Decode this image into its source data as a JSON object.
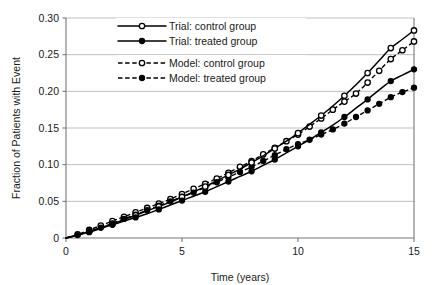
{
  "chart_data": {
    "type": "line",
    "title": "",
    "xlabel": "Time (years)",
    "ylabel": "Fraction of Patients with Event",
    "xlim": [
      0,
      15
    ],
    "ylim": [
      0,
      0.3
    ],
    "xticks": [
      "0",
      "5",
      "10",
      "15"
    ],
    "xtick_values": [
      0,
      5,
      10,
      15
    ],
    "yticks": [
      "0",
      "0.05",
      "0.10",
      "0.15",
      "0.20",
      "0.25",
      "0.30"
    ],
    "ytick_values": [
      0,
      0.05,
      0.1,
      0.15,
      0.2,
      0.25,
      0.3
    ],
    "grid": "horizontal",
    "legend_position": "upper-left-inside",
    "series": [
      {
        "name": "Trial: control group",
        "style": "solid",
        "marker": "open-circle",
        "color": "#000000",
        "x": [
          0,
          0.5,
          1,
          1.5,
          2,
          2.5,
          3,
          3.5,
          4,
          4.5,
          5,
          5.5,
          6,
          6.5,
          7,
          7.5,
          8,
          8.5,
          9,
          9.5,
          10,
          10.5,
          11,
          11.5,
          12,
          12.5,
          13,
          13.5,
          14,
          14.5,
          15
        ],
        "y": [
          0,
          0.004,
          0.009,
          0.014,
          0.019,
          0.025,
          0.031,
          0.037,
          0.043,
          0.049,
          0.056,
          0.063,
          0.07,
          0.078,
          0.086,
          0.094,
          0.103,
          0.112,
          0.122,
          0.132,
          0.143,
          0.155,
          0.167,
          0.18,
          0.194,
          0.209,
          0.225,
          0.242,
          0.259,
          0.271,
          0.283
        ]
      },
      {
        "name": "Trial: treated group",
        "style": "solid",
        "marker": "filled-circle",
        "color": "#000000",
        "x": [
          0,
          0.5,
          1,
          1.5,
          2,
          2.5,
          3,
          3.5,
          4,
          4.5,
          5,
          5.5,
          6,
          6.5,
          7,
          7.5,
          8,
          8.5,
          9,
          9.5,
          10,
          10.5,
          11,
          11.5,
          12,
          12.5,
          13,
          13.5,
          14,
          14.5,
          15
        ],
        "y": [
          0,
          0.004,
          0.008,
          0.013,
          0.018,
          0.023,
          0.028,
          0.033,
          0.039,
          0.045,
          0.051,
          0.057,
          0.063,
          0.07,
          0.077,
          0.084,
          0.091,
          0.099,
          0.107,
          0.116,
          0.125,
          0.134,
          0.144,
          0.154,
          0.165,
          0.177,
          0.189,
          0.202,
          0.214,
          0.222,
          0.23
        ]
      },
      {
        "name": "Model: control group",
        "style": "dashed",
        "marker": "open-circle",
        "color": "#000000",
        "x": [
          0,
          0.5,
          1,
          1.5,
          2,
          2.5,
          3,
          3.5,
          4,
          4.5,
          5,
          5.5,
          6,
          6.5,
          7,
          7.5,
          8,
          8.5,
          9,
          9.5,
          10,
          10.5,
          11,
          11.5,
          12,
          12.5,
          13,
          13.5,
          14,
          14.5,
          15
        ],
        "y": [
          0,
          0.005,
          0.011,
          0.017,
          0.023,
          0.029,
          0.035,
          0.041,
          0.047,
          0.053,
          0.06,
          0.067,
          0.074,
          0.081,
          0.089,
          0.097,
          0.105,
          0.114,
          0.123,
          0.132,
          0.141,
          0.152,
          0.163,
          0.175,
          0.186,
          0.197,
          0.212,
          0.228,
          0.244,
          0.256,
          0.268
        ]
      },
      {
        "name": "Model: treated group",
        "style": "dashed",
        "marker": "filled-circle",
        "color": "#000000",
        "x": [
          0,
          0.5,
          1,
          1.5,
          2,
          2.5,
          3,
          3.5,
          4,
          4.5,
          5,
          5.5,
          6,
          6.5,
          7,
          7.5,
          8,
          8.5,
          9,
          9.5,
          10,
          10.5,
          11,
          11.5,
          12,
          12.5,
          13,
          13.5,
          14,
          14.5,
          15
        ],
        "y": [
          0,
          0.004,
          0.009,
          0.014,
          0.02,
          0.026,
          0.032,
          0.038,
          0.044,
          0.05,
          0.056,
          0.062,
          0.069,
          0.076,
          0.083,
          0.09,
          0.097,
          0.105,
          0.113,
          0.121,
          0.128,
          0.134,
          0.141,
          0.148,
          0.156,
          0.165,
          0.174,
          0.183,
          0.192,
          0.199,
          0.205
        ]
      }
    ]
  },
  "legend": {
    "items": [
      {
        "label": "Trial: control group"
      },
      {
        "label": "Trial: treated group"
      },
      {
        "label": "Model: control group"
      },
      {
        "label": "Model: treated group"
      }
    ]
  },
  "axes": {
    "y_title": "Fraction of Patients with Event",
    "x_title": "Time (years)"
  },
  "colors": {
    "ink": "#000000",
    "grid": "#b0b0b0",
    "axis": "#777777",
    "background": "#ffffff"
  }
}
